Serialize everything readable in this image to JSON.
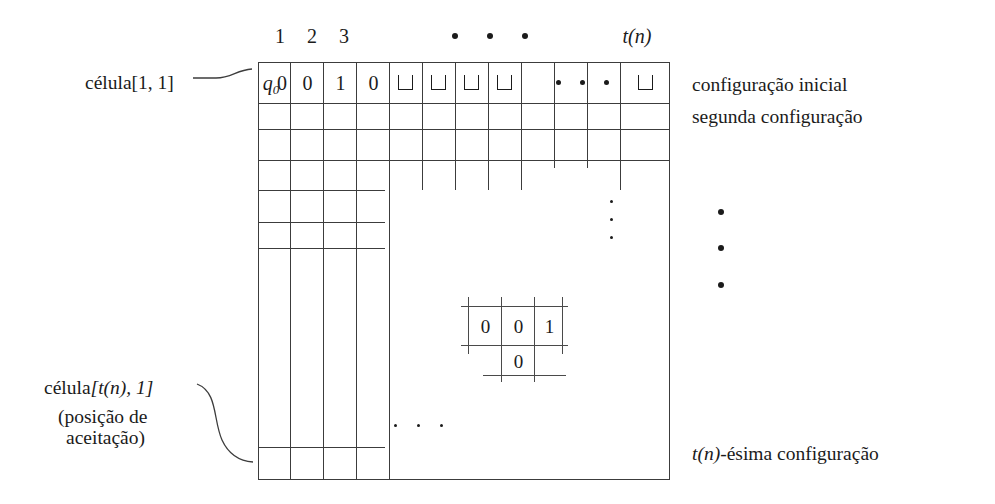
{
  "figure": {
    "title_caption": "",
    "language": "pt"
  },
  "column_headers": [
    "1",
    "2",
    "3",
    "t(n)"
  ],
  "header_dots_count": 3,
  "tape_row": {
    "state_symbol": "q0",
    "cells": [
      "0",
      "0",
      "1",
      "0",
      "⊔",
      "⊔",
      "⊔",
      "⊔",
      "dots",
      "⊔"
    ],
    "blank_symbol": "⊔",
    "inner_dots_count": 3
  },
  "left_labels": {
    "top": {
      "text": "célula[1, 1]",
      "italic_part": "célula",
      "bracket_part": "[1, 1]"
    },
    "bottom": {
      "italic_part": "célula",
      "bracket_part": "[t(n), 1]",
      "note_line1": "(posição de",
      "note_line2": "aceitação)"
    }
  },
  "right_labels": {
    "line1": "configuração inicial",
    "line2": "segunda configuração",
    "last": "t(n)-ésima configuração"
  },
  "vertical_dots_inner_count": 3,
  "vertical_dots_outer_count": 3,
  "horizontal_dots_bottom_count": 3,
  "detail_inset": {
    "top_row": [
      "0",
      "0",
      "1"
    ],
    "bottom_row": [
      "0"
    ]
  },
  "colors": {
    "ink": "#1b1b1b",
    "rule": "#3c3c3c",
    "background": "#ffffff"
  }
}
